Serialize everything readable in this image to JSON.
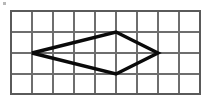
{
  "figure": {
    "background_color": "#ffffff",
    "grid": {
      "name": "square-grid",
      "columns": 9,
      "rows": 4,
      "cell_size_px": 21,
      "origin_x_px": 11,
      "origin_y_px": 11,
      "line_color": "#6e6e6e",
      "border_color": "#5a5a5a",
      "line_width_px": 1.1,
      "border_width_px": 1.6,
      "vertical_line_x_px": [
        11,
        32,
        53,
        74,
        95,
        116,
        137,
        158,
        179,
        200
      ],
      "horizontal_line_y_px": [
        11,
        32,
        53,
        74,
        95
      ]
    },
    "shape": {
      "name": "rhombus",
      "type": "quadrilateral",
      "stroke_color": "#0a0a0a",
      "stroke_width_px": 3.4,
      "fill": "none",
      "vertices_grid": [
        {
          "label": "left",
          "col": 1,
          "row": 2
        },
        {
          "label": "top",
          "col": 5,
          "row": 1
        },
        {
          "label": "right",
          "col": 7,
          "row": 2
        },
        {
          "label": "bottom",
          "col": 5,
          "row": 3
        }
      ],
      "vertices_px": [
        {
          "label": "left",
          "x": 32,
          "y": 53
        },
        {
          "label": "top",
          "x": 116,
          "y": 32
        },
        {
          "label": "right",
          "x": 158,
          "y": 53
        },
        {
          "label": "bottom",
          "x": 116,
          "y": 74
        }
      ],
      "points_attr": "32,53 116,32 158,53 116,74",
      "horizontal_diagonal_cells": 6,
      "vertical_diagonal_cells": 2
    },
    "artifacts": [
      {
        "name": "scan-speck-top-left",
        "x": 3,
        "y": 2,
        "w": 3,
        "h": 3
      }
    ]
  }
}
